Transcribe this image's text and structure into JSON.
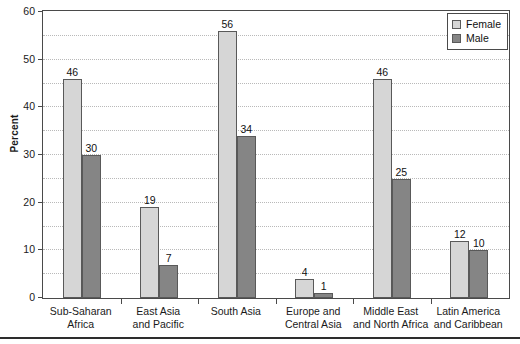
{
  "chart_data": {
    "type": "bar",
    "title": "",
    "xlabel": "",
    "ylabel": "Percent",
    "ylim": [
      0,
      60
    ],
    "ytick_values": [
      0,
      10,
      20,
      30,
      40,
      50,
      60
    ],
    "ytick_labels": [
      "0",
      "10",
      "20",
      "30",
      "40",
      "50",
      "60"
    ],
    "grid": true,
    "grid_step": 5,
    "grid_style": "dotted horizontal",
    "legend_position": "top-right inside plot",
    "categories": [
      "Sub-Saharan Africa",
      "East Asia and Pacific",
      "South Asia",
      "Europe and Central Asia",
      "Middle East and North Africa",
      "Latin America and Caribbean"
    ],
    "category_lines": [
      [
        "Sub-Saharan",
        "Africa"
      ],
      [
        "East Asia",
        "and Pacific"
      ],
      [
        "South Asia"
      ],
      [
        "Europe and",
        "Central Asia"
      ],
      [
        "Middle East",
        "and North Africa"
      ],
      [
        "Latin America",
        "and Caribbean"
      ]
    ],
    "series": [
      {
        "name": "Female",
        "color": "#d6d6d6",
        "values": [
          46,
          19,
          56,
          4,
          46,
          12
        ]
      },
      {
        "name": "Male",
        "color": "#858585",
        "values": [
          30,
          7,
          34,
          1,
          25,
          10
        ]
      }
    ]
  },
  "legend": {
    "entries": [
      {
        "label": "Female",
        "swatch": "female"
      },
      {
        "label": "Male",
        "swatch": "male"
      }
    ]
  },
  "colors": {
    "female_bar": "#d6d6d6",
    "male_bar": "#858585",
    "axis": "#4a4a4a",
    "gridline": "#b9b9b9",
    "background": "#ffffff"
  }
}
